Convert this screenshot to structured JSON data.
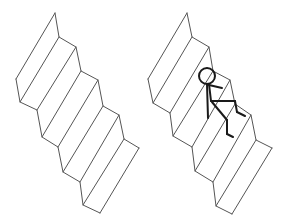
{
  "diagram": {
    "panels": [
      {
        "name": "staircase-empty",
        "stroke": "#555555",
        "right_profile": [
          [
            55,
            13
          ],
          [
            59,
            37
          ],
          [
            76,
            47
          ],
          [
            81,
            71
          ],
          [
            98,
            80
          ],
          [
            103,
            106
          ],
          [
            119,
            115
          ],
          [
            124,
            139
          ],
          [
            139,
            148
          ]
        ],
        "left_profile": [
          [
            16,
            79
          ],
          [
            20,
            102
          ],
          [
            37,
            110
          ],
          [
            42,
            137
          ],
          [
            58,
            147
          ],
          [
            63,
            172
          ],
          [
            80,
            182
          ],
          [
            83,
            205
          ],
          [
            100,
            213
          ]
        ],
        "has_figure": false
      },
      {
        "name": "staircase-with-figure",
        "stroke": "#555555",
        "right_profile": [
          [
            187,
            13
          ],
          [
            192,
            37
          ],
          [
            209,
            47
          ],
          [
            213,
            71
          ],
          [
            230,
            80
          ],
          [
            235,
            104
          ],
          [
            251,
            115
          ],
          [
            256,
            140
          ],
          [
            272,
            148
          ]
        ],
        "left_profile": [
          [
            148,
            79
          ],
          [
            153,
            103
          ],
          [
            170,
            113
          ],
          [
            173,
            136
          ],
          [
            192,
            147
          ],
          [
            195,
            171
          ],
          [
            213,
            182
          ],
          [
            216,
            206
          ],
          [
            232,
            214
          ]
        ],
        "has_figure": true
      }
    ],
    "figure": {
      "stroke": "#1a1a1a",
      "head": {
        "cx": 207,
        "cy": 76,
        "r": 8
      },
      "segments": [
        [
          [
            207,
            84
          ],
          [
            208,
            118
          ]
        ],
        [
          [
            209,
            85
          ],
          [
            222,
            88
          ]
        ],
        [
          [
            209,
            84
          ],
          [
            211,
            101
          ]
        ],
        [
          [
            211,
            101
          ],
          [
            235,
            101
          ]
        ],
        [
          [
            235,
            101
          ],
          [
            237,
            112
          ]
        ],
        [
          [
            237,
            112
          ],
          [
            245,
            116
          ]
        ],
        [
          [
            212,
            102
          ],
          [
            227,
            120
          ]
        ],
        [
          [
            227,
            120
          ],
          [
            227,
            134
          ]
        ],
        [
          [
            227,
            134
          ],
          [
            233,
            137
          ]
        ]
      ]
    }
  }
}
